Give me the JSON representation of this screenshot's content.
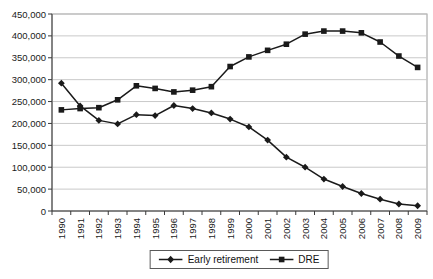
{
  "chart_data": {
    "type": "line",
    "title": "",
    "xlabel": "",
    "ylabel": "",
    "x_categories": [
      "1990",
      "1991",
      "1992",
      "1993",
      "1994",
      "1995",
      "1996",
      "1997",
      "1998",
      "1999",
      "2000",
      "2001",
      "2002",
      "2003",
      "2004",
      "2005",
      "2006",
      "2007",
      "2008",
      "2009"
    ],
    "series": [
      {
        "name": "Early retirement",
        "marker": "diamond",
        "color": "#1a1a1a",
        "values": [
          292000,
          240000,
          207000,
          199000,
          220000,
          218000,
          241000,
          234000,
          224000,
          210000,
          192000,
          162000,
          123000,
          100000,
          73000,
          56000,
          40000,
          27000,
          16000,
          12000
        ]
      },
      {
        "name": "DRE",
        "marker": "square",
        "color": "#1a1a1a",
        "values": [
          231000,
          234000,
          236000,
          254000,
          286000,
          280000,
          272000,
          276000,
          284000,
          330000,
          352000,
          367000,
          381000,
          404000,
          411000,
          411000,
          407000,
          386000,
          354000,
          328000
        ]
      }
    ],
    "y_axis": {
      "min": 0,
      "max": 450000,
      "step": 50000,
      "tick_labels": [
        "0",
        "50,000",
        "100,000",
        "150,000",
        "200,000",
        "250,000",
        "300,000",
        "350,000",
        "400,000",
        "450,000"
      ]
    },
    "grid": {
      "horizontal": true,
      "vertical": false,
      "color": "#c9c9c9"
    },
    "plot_border_color": "#9a9a9a",
    "axis_color": "#3a3a3a",
    "background": "#ffffff",
    "legend": {
      "position": "bottom-center"
    }
  }
}
